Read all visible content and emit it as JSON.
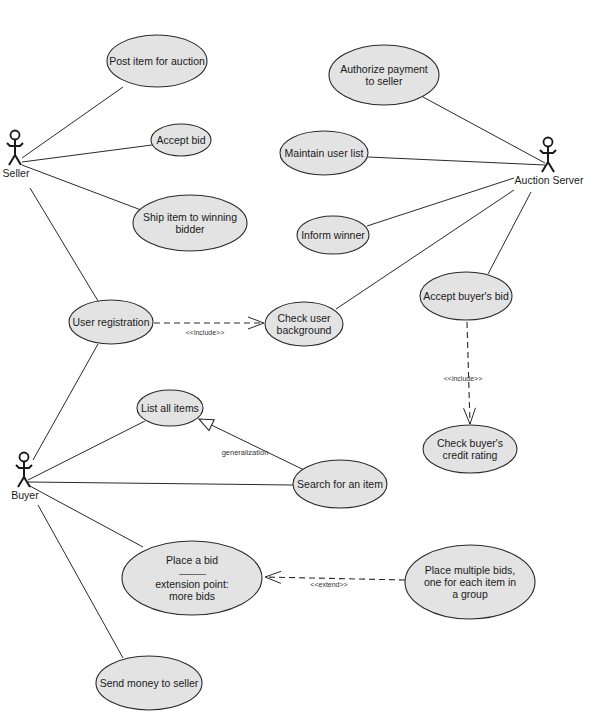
{
  "diagram": {
    "type": "uml-use-case",
    "colors": {
      "ellipse_fill": "#e3e3e3",
      "stroke": "#2a2a2a",
      "background": "#ffffff"
    },
    "actors": [
      {
        "id": "seller",
        "label": "Seller",
        "x": 15,
        "y": 130
      },
      {
        "id": "auction_server",
        "label": "Auction Server",
        "x": 548,
        "y": 137
      },
      {
        "id": "buyer",
        "label": "Buyer",
        "x": 24,
        "y": 452
      }
    ],
    "use_cases": [
      {
        "id": "post_item",
        "lines": [
          "Post item for auction"
        ],
        "cx": 157,
        "cy": 61,
        "rx": 50,
        "ry": 26
      },
      {
        "id": "accept_bid",
        "lines": [
          "Accept bid"
        ],
        "cx": 181,
        "cy": 140,
        "rx": 30,
        "ry": 16
      },
      {
        "id": "ship_item",
        "lines": [
          "Ship item to winning",
          "bidder"
        ],
        "cx": 190,
        "cy": 223,
        "rx": 57,
        "ry": 28
      },
      {
        "id": "authorize_payment",
        "lines": [
          "Authorize payment",
          "to seller"
        ],
        "cx": 384,
        "cy": 75,
        "rx": 55,
        "ry": 30
      },
      {
        "id": "maintain_users",
        "lines": [
          "Maintain user list"
        ],
        "cx": 324,
        "cy": 153,
        "rx": 44,
        "ry": 22
      },
      {
        "id": "inform_winner",
        "lines": [
          "Inform winner"
        ],
        "cx": 333,
        "cy": 235,
        "rx": 36,
        "ry": 19
      },
      {
        "id": "user_registration",
        "lines": [
          "User registration"
        ],
        "cx": 111,
        "cy": 322,
        "rx": 42,
        "ry": 22
      },
      {
        "id": "check_background",
        "lines": [
          "Check user",
          "background"
        ],
        "cx": 304,
        "cy": 324,
        "rx": 39,
        "ry": 22
      },
      {
        "id": "accept_buyers_bid",
        "lines": [
          "Accept buyer's bid"
        ],
        "cx": 466,
        "cy": 296,
        "rx": 46,
        "ry": 24
      },
      {
        "id": "check_credit",
        "lines": [
          "Check buyer's",
          "credit rating"
        ],
        "cx": 470,
        "cy": 449,
        "rx": 47,
        "ry": 24
      },
      {
        "id": "list_items",
        "lines": [
          "List all items"
        ],
        "cx": 170,
        "cy": 408,
        "rx": 33,
        "ry": 18
      },
      {
        "id": "search_item",
        "lines": [
          "Search for an item"
        ],
        "cx": 340,
        "cy": 484,
        "rx": 47,
        "ry": 24
      },
      {
        "id": "place_bid",
        "lines": [
          "Place a bid",
          "----------------",
          "extension point:",
          "more bids"
        ],
        "cx": 192,
        "cy": 578,
        "rx": 70,
        "ry": 37
      },
      {
        "id": "place_multiple",
        "lines": [
          "Place multiple bids,",
          "one for each item in",
          "a group"
        ],
        "cx": 470,
        "cy": 582,
        "rx": 65,
        "ry": 37
      },
      {
        "id": "send_money",
        "lines": [
          "Send money to seller"
        ],
        "cx": 149,
        "cy": 683,
        "rx": 53,
        "ry": 27
      }
    ],
    "associations": [
      {
        "from": "seller",
        "to": "post_item",
        "x1": 22,
        "y1": 158,
        "x2": 123,
        "y2": 87
      },
      {
        "from": "seller",
        "to": "accept_bid",
        "x1": 22,
        "y1": 162,
        "x2": 152,
        "y2": 145
      },
      {
        "from": "seller",
        "to": "ship_item",
        "x1": 22,
        "y1": 165,
        "x2": 141,
        "y2": 210
      },
      {
        "from": "seller",
        "to": "user_registration",
        "x1": 30,
        "y1": 188,
        "x2": 98,
        "y2": 301
      },
      {
        "from": "auction_server",
        "to": "authorize_payment",
        "x1": 545,
        "y1": 163,
        "x2": 423,
        "y2": 97
      },
      {
        "from": "auction_server",
        "to": "maintain_users",
        "x1": 545,
        "y1": 165,
        "x2": 368,
        "y2": 157
      },
      {
        "from": "auction_server",
        "to": "inform_winner",
        "x1": 514,
        "y1": 178,
        "x2": 367,
        "y2": 226
      },
      {
        "from": "auction_server",
        "to": "check_background",
        "x1": 514,
        "y1": 190,
        "x2": 336,
        "y2": 309
      },
      {
        "from": "auction_server",
        "to": "accept_buyers_bid",
        "x1": 531,
        "y1": 192,
        "x2": 488,
        "y2": 274
      },
      {
        "from": "buyer",
        "to": "user_registration",
        "x1": 33,
        "y1": 460,
        "x2": 98,
        "y2": 344
      },
      {
        "from": "buyer",
        "to": "list_items",
        "x1": 28,
        "y1": 480,
        "x2": 145,
        "y2": 421
      },
      {
        "from": "buyer",
        "to": "search_item",
        "x1": 28,
        "y1": 482,
        "x2": 293,
        "y2": 485
      },
      {
        "from": "buyer",
        "to": "place_bid",
        "x1": 28,
        "y1": 485,
        "x2": 143,
        "y2": 547
      },
      {
        "from": "buyer",
        "to": "send_money",
        "x1": 38,
        "y1": 505,
        "x2": 123,
        "y2": 658
      }
    ],
    "relations": [
      {
        "kind": "include",
        "label": "<<include>>",
        "from": "user_registration",
        "to": "check_background",
        "x1": 154,
        "y1": 323,
        "x2": 264,
        "y2": 323,
        "label_x": 205,
        "label_y": 335
      },
      {
        "kind": "include",
        "label": "<<include>>",
        "from": "accept_buyers_bid",
        "to": "check_credit",
        "x1": 467,
        "y1": 322,
        "x2": 470,
        "y2": 424,
        "label_x": 463,
        "label_y": 381
      },
      {
        "kind": "extend",
        "label": "<<extend>>",
        "from": "place_multiple",
        "to": "place_bid",
        "x1": 405,
        "y1": 580,
        "x2": 265,
        "y2": 577,
        "label_x": 329,
        "label_y": 587
      },
      {
        "kind": "generalization",
        "label": "generalization",
        "from": "search_item",
        "to": "list_items",
        "x1": 302,
        "y1": 469,
        "x2": 199,
        "y2": 419,
        "label_x": 245,
        "label_y": 455
      }
    ]
  }
}
